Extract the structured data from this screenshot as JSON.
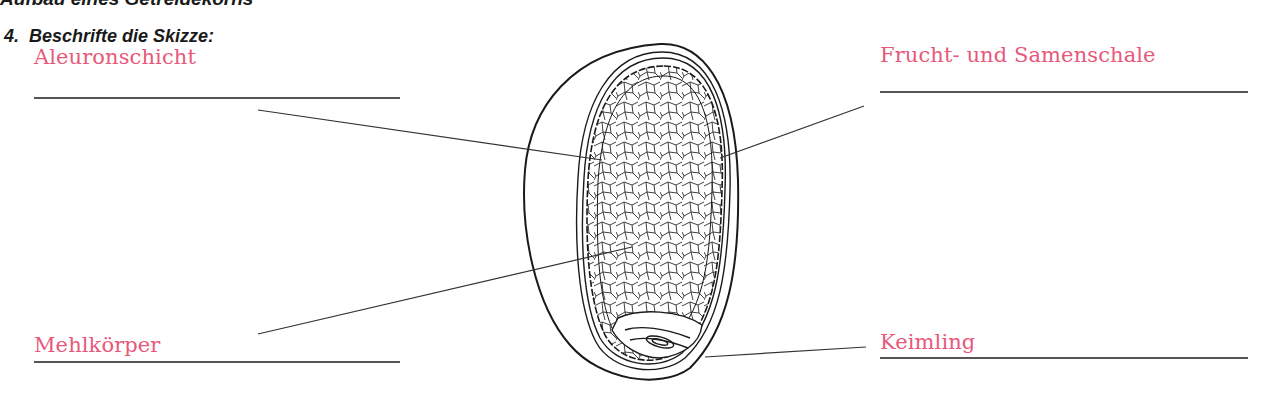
{
  "document": {
    "section_title": "Aufbau eines Getreidekorns",
    "task": {
      "number": "4.",
      "instruction": "Beschrifte die Skizze:"
    }
  },
  "diagram": {
    "labels": [
      {
        "id": "aleuronschicht",
        "text": "Aleuronschicht",
        "side": "left",
        "position": "top"
      },
      {
        "id": "frucht-und-samenschale",
        "text": "Frucht- und Samenschale",
        "side": "right",
        "position": "top"
      },
      {
        "id": "mehlkoerper",
        "text": "Mehlkörper",
        "side": "left",
        "position": "bottom"
      },
      {
        "id": "keimling",
        "text": "Keimling",
        "side": "right",
        "position": "bottom"
      }
    ]
  },
  "colors": {
    "answer_text": "#e8587a",
    "rule_line": "#555555",
    "drawing": "#1a1a1a"
  }
}
